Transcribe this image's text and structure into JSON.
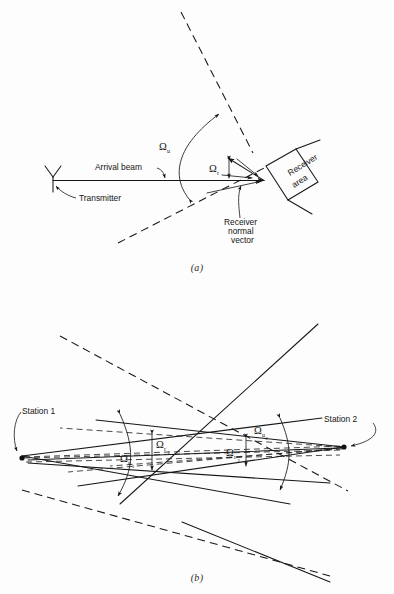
{
  "figure": {
    "panel_a": {
      "caption": "(a)",
      "labels": {
        "transmitter": "Transmitter",
        "arrival_beam": "Arrival beam",
        "receiver_area_line1": "Receiver",
        "receiver_area_line2": "area",
        "receiver_normal_line1": "Receiver",
        "receiver_normal_line2": "normal",
        "receiver_normal_line3": "vector",
        "omega_u": "Ω",
        "omega_u_sub": "u",
        "omega_r": "Ω",
        "omega_r_sub": "r"
      }
    },
    "panel_b": {
      "caption": "(b)",
      "labels": {
        "station_1": "Station 1",
        "station_2": "Station 2",
        "omega_u1": "Ω",
        "omega_u1_sub": "u",
        "omega_u1_sub2": "1",
        "omega_r1": "Ω",
        "omega_r1_sub": "r",
        "omega_r1_sub2": "1",
        "omega_u2": "Ω",
        "omega_u2_sub": "u",
        "omega_u2_sub2": "2",
        "omega_r2": "Ω",
        "omega_r2_sub": "r",
        "omega_r2_sub2": "2"
      }
    }
  },
  "colors": {
    "ink": "#161616",
    "page": "#fdfdfd"
  }
}
